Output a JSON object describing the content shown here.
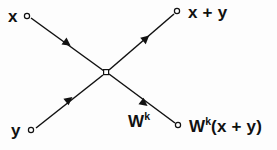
{
  "figure": {
    "kind": "butterfly-signal-flow-diagram",
    "background_color": "#fdfdfd",
    "stroke_color": "#111111",
    "width": 277,
    "height": 150
  },
  "nodes": {
    "input_top": {
      "label": "x",
      "marker": "open-circle",
      "x": 27,
      "y": 16
    },
    "input_bottom": {
      "label": "y",
      "marker": "open-circle",
      "x": 31,
      "y": 130
    },
    "center": {
      "label": "",
      "marker": "open-square",
      "x": 106,
      "y": 72
    },
    "output_top": {
      "label_parts": {
        "base": "x + y",
        "sup": ""
      },
      "label": "x + y",
      "marker": "open-circle",
      "x": 177,
      "y": 11
    },
    "output_bottom": {
      "label_parts": {
        "base_lead": "W",
        "sup": "k",
        "base_tail": "(x + y)"
      },
      "label": "W^k(x + y)",
      "marker": "open-circle",
      "x": 178,
      "y": 125
    }
  },
  "edges": {
    "x_to_center": {
      "from": "input_top",
      "to": "center",
      "arrow": "midpoint-forward",
      "direction": "down-right"
    },
    "y_to_center": {
      "from": "input_bottom",
      "to": "center",
      "arrow": "midpoint-forward",
      "direction": "up-right"
    },
    "center_to_sum": {
      "from": "center",
      "to": "output_top",
      "arrow": "midpoint-forward",
      "direction": "up-right"
    },
    "center_to_twiddle": {
      "from": "center",
      "to": "output_bottom",
      "arrow": "midpoint-forward",
      "direction": "down-right",
      "edge_label_parts": {
        "base": "W",
        "sup": "k"
      },
      "edge_label": "W^k"
    }
  }
}
